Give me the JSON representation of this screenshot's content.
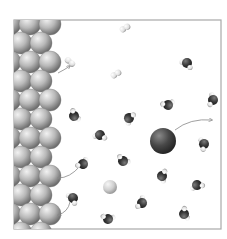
{
  "diagram": {
    "frame": {
      "x": 14,
      "y": 20,
      "w": 207,
      "h": 209,
      "stroke": "#a8a8a8"
    },
    "colors": {
      "background": "#ffffff",
      "metal_sphere": "#b8b8b8",
      "oxygen": "#3a3a3a",
      "hydrogen": "#e4e4e4",
      "large_ion": "#4a4a4a",
      "small_ion": "#cfcfcf",
      "arrow": "#888888"
    },
    "surface_rows": 11,
    "h2_molecules": [
      {
        "x": 125,
        "y": 28,
        "angle": -30
      },
      {
        "x": 116,
        "y": 74,
        "angle": -30
      },
      {
        "x": 70,
        "y": 62,
        "angle": 40
      }
    ],
    "water_molecules": [
      {
        "x": 187,
        "y": 63
      },
      {
        "x": 213,
        "y": 100
      },
      {
        "x": 168,
        "y": 105
      },
      {
        "x": 74,
        "y": 116
      },
      {
        "x": 129,
        "y": 118
      },
      {
        "x": 100,
        "y": 135
      },
      {
        "x": 204,
        "y": 144
      },
      {
        "x": 83,
        "y": 164
      },
      {
        "x": 123,
        "y": 161
      },
      {
        "x": 162,
        "y": 176
      },
      {
        "x": 197,
        "y": 185
      },
      {
        "x": 73,
        "y": 198
      },
      {
        "x": 142,
        "y": 203
      },
      {
        "x": 108,
        "y": 219
      },
      {
        "x": 184,
        "y": 214
      }
    ],
    "large_ion": {
      "x": 163,
      "y": 141,
      "r": 13
    },
    "small_ion": {
      "x": 110,
      "y": 187,
      "r": 7
    },
    "arrows": [
      {
        "from": [
          58,
          73
        ],
        "ctrl": [
          64,
          70
        ],
        "to": [
          70,
          66
        ]
      },
      {
        "from": [
          175,
          130
        ],
        "ctrl": [
          190,
          118
        ],
        "to": [
          212,
          120
        ]
      },
      {
        "from": [
          80,
          166
        ],
        "ctrl": [
          70,
          178
        ],
        "to": [
          58,
          178
        ]
      },
      {
        "from": [
          70,
          202
        ],
        "ctrl": [
          68,
          212
        ],
        "to": [
          58,
          215
        ]
      }
    ]
  }
}
